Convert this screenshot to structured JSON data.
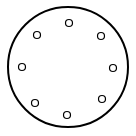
{
  "diagram": {
    "title": "",
    "type": "bolt-circle-pattern",
    "canvas": {
      "width": 136,
      "height": 136,
      "background": "#ffffff"
    },
    "outer_circle": {
      "cx": 68,
      "cy": 67,
      "r": 60,
      "stroke": "#000000",
      "stroke_width": 2,
      "fill": "none"
    },
    "holes": [
      {
        "id": "top",
        "cx": 69,
        "cy": 23,
        "r": 3.5
      },
      {
        "id": "upper-right",
        "cx": 101,
        "cy": 36,
        "r": 3.5
      },
      {
        "id": "right",
        "cx": 113,
        "cy": 68,
        "r": 3.5
      },
      {
        "id": "lower-right",
        "cx": 102,
        "cy": 99,
        "r": 3.5
      },
      {
        "id": "bottom",
        "cx": 67,
        "cy": 115,
        "r": 3.5
      },
      {
        "id": "lower-left",
        "cx": 35,
        "cy": 103,
        "r": 3.5
      },
      {
        "id": "left",
        "cx": 22,
        "cy": 67,
        "r": 3.5
      },
      {
        "id": "upper-left",
        "cx": 37,
        "cy": 35,
        "r": 3.5
      }
    ],
    "hole_style": {
      "stroke": "#000000",
      "stroke_width": 1.2,
      "fill": "#ffffff"
    },
    "hole_count": 8
  }
}
